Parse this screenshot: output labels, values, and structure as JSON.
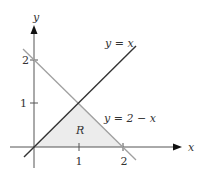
{
  "figure": {
    "axes": {
      "x_label": "x",
      "y_label": "y"
    },
    "x_ticks": [
      "1",
      "2"
    ],
    "y_ticks": [
      "1",
      "2"
    ],
    "lines": [
      {
        "label": "y = x",
        "color": "#333333"
      },
      {
        "label": "y = 2 − x",
        "color": "#999999"
      }
    ],
    "region": {
      "label": "R",
      "fill": "#ececec",
      "vertices": [
        [
          0,
          0
        ],
        [
          1,
          1
        ],
        [
          2,
          0
        ]
      ]
    }
  }
}
